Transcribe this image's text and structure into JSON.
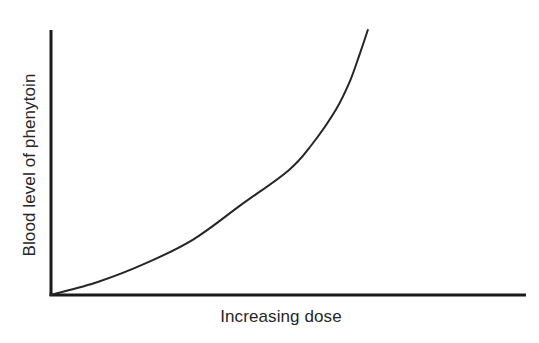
{
  "chart_data": {
    "type": "line",
    "title": "",
    "xlabel": "Increasing dose",
    "ylabel": "Blood level of phenytoin",
    "grid": false,
    "legend": null,
    "ticks": {
      "x": [],
      "y": []
    },
    "xlim": [
      0,
      1
    ],
    "ylim": [
      0,
      1
    ],
    "series": [
      {
        "name": "Phenytoin blood level vs dose",
        "x": [
          0.0,
          0.1,
          0.2,
          0.3,
          0.4,
          0.5,
          0.55,
          0.6,
          0.63,
          0.65,
          0.667
        ],
        "y": [
          0.0,
          0.05,
          0.12,
          0.21,
          0.34,
          0.47,
          0.57,
          0.7,
          0.81,
          0.91,
          1.0
        ]
      }
    ],
    "annotation": "Non-linear (saturation) kinetics: blood level rises disproportionately steeply at higher doses"
  },
  "colors": {
    "axis": "#1a1a1a",
    "curve": "#262626",
    "text": "#262626",
    "background": "#ffffff"
  }
}
